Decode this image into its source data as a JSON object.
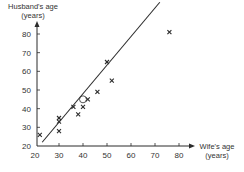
{
  "chart_data": {
    "type": "scatter",
    "title": "",
    "xlabel": "Wife's age (years)",
    "ylabel": "Husband's age (years)",
    "xlabel_lines": [
      "Wife's age",
      "(years)"
    ],
    "ylabel_lines": [
      "Husband's age",
      "(years)"
    ],
    "xlim": [
      20,
      85
    ],
    "ylim": [
      20,
      88
    ],
    "x_ticks": [
      20,
      30,
      40,
      50,
      60,
      70,
      80
    ],
    "y_ticks": [
      20,
      30,
      40,
      50,
      60,
      70,
      80
    ],
    "grid": false,
    "legend": null,
    "marker": "x",
    "series": [
      {
        "name": "Couples",
        "points": [
          {
            "x": 22,
            "y": 26
          },
          {
            "x": 30,
            "y": 35
          },
          {
            "x": 30,
            "y": 33
          },
          {
            "x": 30,
            "y": 28
          },
          {
            "x": 36,
            "y": 41
          },
          {
            "x": 38,
            "y": 37
          },
          {
            "x": 40,
            "y": 41
          },
          {
            "x": 42,
            "y": 45
          },
          {
            "x": 46,
            "y": 49
          },
          {
            "x": 50,
            "y": 65
          },
          {
            "x": 52,
            "y": 55
          },
          {
            "x": 76,
            "y": 81
          }
        ]
      }
    ],
    "fit_line": {
      "x1": 23,
      "y1": 22,
      "x2": 72,
      "y2": 97
    },
    "annotations": [
      {
        "type": "circle",
        "x": 40,
        "y": 45,
        "label": "mean point"
      }
    ]
  },
  "colors": {
    "ink": "#2b2b2b",
    "text": "#333333",
    "background": "#ffffff"
  }
}
